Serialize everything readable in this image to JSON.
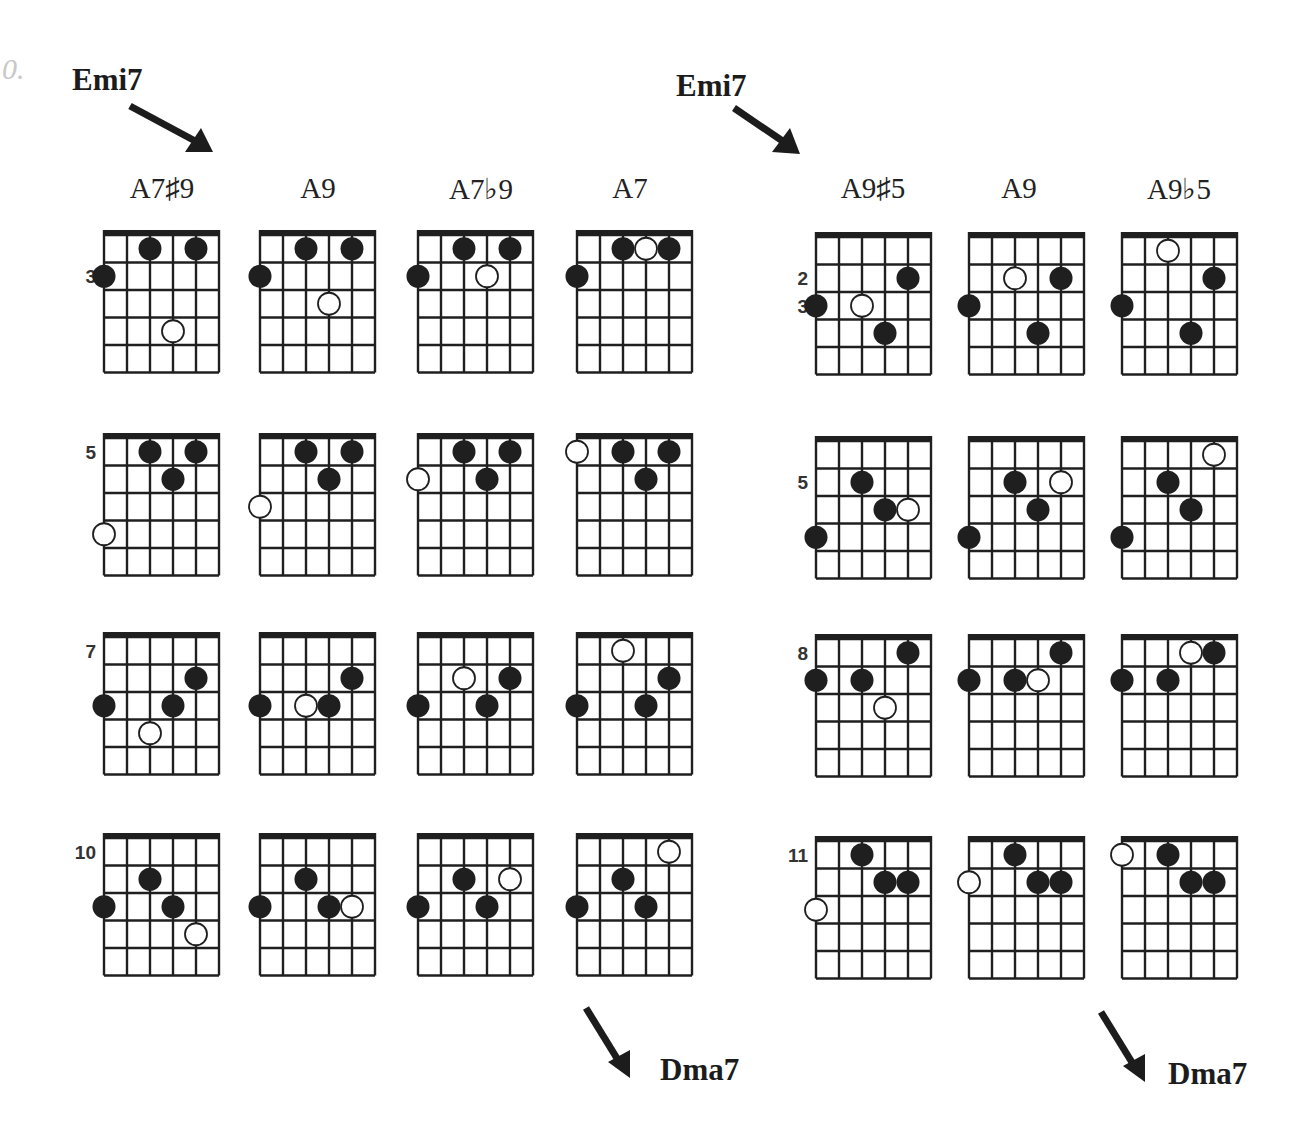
{
  "exercise_number": "0.",
  "left_block": {
    "start_chord": "Emi7",
    "end_chord": "Dma7",
    "columns": [
      "A7♯9",
      "A9",
      "A7♭9",
      "A7"
    ]
  },
  "right_block": {
    "start_chord": "Emi7",
    "end_chord": "Dma7",
    "columns": [
      "A9♯5",
      "A9",
      "A9♭5"
    ]
  },
  "colors": {
    "ink": "#1f1f1f",
    "open_fill": "#ffffff"
  },
  "diagram_spec": {
    "strings": 6,
    "frets": 5,
    "string_order": "low E (left) to high E (right)"
  },
  "diagrams": [
    {
      "block": "left",
      "row": 0,
      "col": 0,
      "chord": "A7♯9",
      "fret_labels": [
        {
          "fret": 2,
          "text": "3"
        }
      ],
      "dots": [
        {
          "s": 2,
          "f": 1,
          "t": "filled"
        },
        {
          "s": 4,
          "f": 1,
          "t": "filled"
        },
        {
          "s": 0,
          "f": 2,
          "t": "filled"
        },
        {
          "s": 3,
          "f": 4,
          "t": "open"
        }
      ]
    },
    {
      "block": "left",
      "row": 0,
      "col": 1,
      "chord": "A9",
      "fret_labels": [],
      "dots": [
        {
          "s": 2,
          "f": 1,
          "t": "filled"
        },
        {
          "s": 4,
          "f": 1,
          "t": "filled"
        },
        {
          "s": 0,
          "f": 2,
          "t": "filled"
        },
        {
          "s": 3,
          "f": 3,
          "t": "open"
        }
      ]
    },
    {
      "block": "left",
      "row": 0,
      "col": 2,
      "chord": "A7♭9",
      "fret_labels": [],
      "dots": [
        {
          "s": 2,
          "f": 1,
          "t": "filled"
        },
        {
          "s": 4,
          "f": 1,
          "t": "filled"
        },
        {
          "s": 0,
          "f": 2,
          "t": "filled"
        },
        {
          "s": 3,
          "f": 2,
          "t": "open"
        }
      ]
    },
    {
      "block": "left",
      "row": 0,
      "col": 3,
      "chord": "A7",
      "fret_labels": [],
      "dots": [
        {
          "s": 2,
          "f": 1,
          "t": "filled"
        },
        {
          "s": 4,
          "f": 1,
          "t": "filled"
        },
        {
          "s": 0,
          "f": 2,
          "t": "filled"
        },
        {
          "s": 3,
          "f": 1,
          "t": "open"
        }
      ]
    },
    {
      "block": "left",
      "row": 1,
      "col": 0,
      "chord": "A7♯9",
      "fret_labels": [
        {
          "fret": 1,
          "text": "5"
        }
      ],
      "dots": [
        {
          "s": 2,
          "f": 1,
          "t": "filled"
        },
        {
          "s": 4,
          "f": 1,
          "t": "filled"
        },
        {
          "s": 3,
          "f": 2,
          "t": "filled"
        },
        {
          "s": 0,
          "f": 4,
          "t": "open"
        }
      ]
    },
    {
      "block": "left",
      "row": 1,
      "col": 1,
      "chord": "A9",
      "fret_labels": [],
      "dots": [
        {
          "s": 2,
          "f": 1,
          "t": "filled"
        },
        {
          "s": 4,
          "f": 1,
          "t": "filled"
        },
        {
          "s": 3,
          "f": 2,
          "t": "filled"
        },
        {
          "s": 0,
          "f": 3,
          "t": "open"
        }
      ]
    },
    {
      "block": "left",
      "row": 1,
      "col": 2,
      "chord": "A7♭9",
      "fret_labels": [],
      "dots": [
        {
          "s": 2,
          "f": 1,
          "t": "filled"
        },
        {
          "s": 4,
          "f": 1,
          "t": "filled"
        },
        {
          "s": 3,
          "f": 2,
          "t": "filled"
        },
        {
          "s": 0,
          "f": 2,
          "t": "open"
        }
      ]
    },
    {
      "block": "left",
      "row": 1,
      "col": 3,
      "chord": "A7",
      "fret_labels": [],
      "dots": [
        {
          "s": 0,
          "f": 1,
          "t": "open"
        },
        {
          "s": 2,
          "f": 1,
          "t": "filled"
        },
        {
          "s": 4,
          "f": 1,
          "t": "filled"
        },
        {
          "s": 3,
          "f": 2,
          "t": "filled"
        }
      ]
    },
    {
      "block": "left",
      "row": 2,
      "col": 0,
      "chord": "A7♯9",
      "fret_labels": [
        {
          "fret": 1,
          "text": "7"
        }
      ],
      "dots": [
        {
          "s": 4,
          "f": 2,
          "t": "filled"
        },
        {
          "s": 0,
          "f": 3,
          "t": "filled"
        },
        {
          "s": 3,
          "f": 3,
          "t": "filled"
        },
        {
          "s": 2,
          "f": 4,
          "t": "open"
        }
      ]
    },
    {
      "block": "left",
      "row": 2,
      "col": 1,
      "chord": "A9",
      "fret_labels": [],
      "dots": [
        {
          "s": 4,
          "f": 2,
          "t": "filled"
        },
        {
          "s": 0,
          "f": 3,
          "t": "filled"
        },
        {
          "s": 3,
          "f": 3,
          "t": "filled"
        },
        {
          "s": 2,
          "f": 3,
          "t": "open"
        }
      ]
    },
    {
      "block": "left",
      "row": 2,
      "col": 2,
      "chord": "A7♭9",
      "fret_labels": [],
      "dots": [
        {
          "s": 2,
          "f": 2,
          "t": "open"
        },
        {
          "s": 4,
          "f": 2,
          "t": "filled"
        },
        {
          "s": 0,
          "f": 3,
          "t": "filled"
        },
        {
          "s": 3,
          "f": 3,
          "t": "filled"
        }
      ]
    },
    {
      "block": "left",
      "row": 2,
      "col": 3,
      "chord": "A7",
      "fret_labels": [],
      "dots": [
        {
          "s": 2,
          "f": 1,
          "t": "open"
        },
        {
          "s": 4,
          "f": 2,
          "t": "filled"
        },
        {
          "s": 0,
          "f": 3,
          "t": "filled"
        },
        {
          "s": 3,
          "f": 3,
          "t": "filled"
        }
      ]
    },
    {
      "block": "left",
      "row": 3,
      "col": 0,
      "chord": "A7♯9",
      "fret_labels": [
        {
          "fret": 1,
          "text": "10"
        }
      ],
      "dots": [
        {
          "s": 2,
          "f": 2,
          "t": "filled"
        },
        {
          "s": 0,
          "f": 3,
          "t": "filled"
        },
        {
          "s": 3,
          "f": 3,
          "t": "filled"
        },
        {
          "s": 4,
          "f": 4,
          "t": "open"
        }
      ]
    },
    {
      "block": "left",
      "row": 3,
      "col": 1,
      "chord": "A9",
      "fret_labels": [],
      "dots": [
        {
          "s": 2,
          "f": 2,
          "t": "filled"
        },
        {
          "s": 0,
          "f": 3,
          "t": "filled"
        },
        {
          "s": 3,
          "f": 3,
          "t": "filled"
        },
        {
          "s": 4,
          "f": 3,
          "t": "open"
        }
      ]
    },
    {
      "block": "left",
      "row": 3,
      "col": 2,
      "chord": "A7♭9",
      "fret_labels": [],
      "dots": [
        {
          "s": 2,
          "f": 2,
          "t": "filled"
        },
        {
          "s": 0,
          "f": 3,
          "t": "filled"
        },
        {
          "s": 3,
          "f": 3,
          "t": "filled"
        },
        {
          "s": 4,
          "f": 2,
          "t": "open"
        }
      ]
    },
    {
      "block": "left",
      "row": 3,
      "col": 3,
      "chord": "A7",
      "fret_labels": [],
      "dots": [
        {
          "s": 4,
          "f": 1,
          "t": "open"
        },
        {
          "s": 2,
          "f": 2,
          "t": "filled"
        },
        {
          "s": 0,
          "f": 3,
          "t": "filled"
        },
        {
          "s": 3,
          "f": 3,
          "t": "filled"
        }
      ]
    },
    {
      "block": "right",
      "row": 0,
      "col": 0,
      "chord": "A9♯5",
      "fret_labels": [
        {
          "fret": 2,
          "text": "2"
        },
        {
          "fret": 3,
          "text": "3"
        }
      ],
      "dots": [
        {
          "s": 4,
          "f": 2,
          "t": "filled"
        },
        {
          "s": 0,
          "f": 3,
          "t": "filled"
        },
        {
          "s": 3,
          "f": 4,
          "t": "filled"
        },
        {
          "s": 2,
          "f": 3,
          "t": "open"
        }
      ]
    },
    {
      "block": "right",
      "row": 0,
      "col": 1,
      "chord": "A9",
      "fret_labels": [],
      "dots": [
        {
          "s": 4,
          "f": 2,
          "t": "filled"
        },
        {
          "s": 0,
          "f": 3,
          "t": "filled"
        },
        {
          "s": 3,
          "f": 4,
          "t": "filled"
        },
        {
          "s": 2,
          "f": 2,
          "t": "open"
        }
      ]
    },
    {
      "block": "right",
      "row": 0,
      "col": 2,
      "chord": "A9♭5",
      "fret_labels": [],
      "dots": [
        {
          "s": 2,
          "f": 1,
          "t": "open"
        },
        {
          "s": 4,
          "f": 2,
          "t": "filled"
        },
        {
          "s": 0,
          "f": 3,
          "t": "filled"
        },
        {
          "s": 3,
          "f": 4,
          "t": "filled"
        }
      ]
    },
    {
      "block": "right",
      "row": 1,
      "col": 0,
      "chord": "A9♯5",
      "fret_labels": [
        {
          "fret": 2,
          "text": "5"
        }
      ],
      "dots": [
        {
          "s": 2,
          "f": 2,
          "t": "filled"
        },
        {
          "s": 3,
          "f": 3,
          "t": "filled"
        },
        {
          "s": 0,
          "f": 4,
          "t": "filled"
        },
        {
          "s": 4,
          "f": 3,
          "t": "open"
        }
      ]
    },
    {
      "block": "right",
      "row": 1,
      "col": 1,
      "chord": "A9",
      "fret_labels": [],
      "dots": [
        {
          "s": 2,
          "f": 2,
          "t": "filled"
        },
        {
          "s": 3,
          "f": 3,
          "t": "filled"
        },
        {
          "s": 0,
          "f": 4,
          "t": "filled"
        },
        {
          "s": 4,
          "f": 2,
          "t": "open"
        }
      ]
    },
    {
      "block": "right",
      "row": 1,
      "col": 2,
      "chord": "A9♭5",
      "fret_labels": [],
      "dots": [
        {
          "s": 4,
          "f": 1,
          "t": "open"
        },
        {
          "s": 2,
          "f": 2,
          "t": "filled"
        },
        {
          "s": 3,
          "f": 3,
          "t": "filled"
        },
        {
          "s": 0,
          "f": 4,
          "t": "filled"
        }
      ]
    },
    {
      "block": "right",
      "row": 2,
      "col": 0,
      "chord": "A9♯5",
      "fret_labels": [
        {
          "fret": 1,
          "text": "8"
        }
      ],
      "dots": [
        {
          "s": 4,
          "f": 1,
          "t": "filled"
        },
        {
          "s": 0,
          "f": 2,
          "t": "filled"
        },
        {
          "s": 2,
          "f": 2,
          "t": "filled"
        },
        {
          "s": 3,
          "f": 3,
          "t": "open"
        }
      ]
    },
    {
      "block": "right",
      "row": 2,
      "col": 1,
      "chord": "A9",
      "fret_labels": [],
      "dots": [
        {
          "s": 4,
          "f": 1,
          "t": "filled"
        },
        {
          "s": 0,
          "f": 2,
          "t": "filled"
        },
        {
          "s": 2,
          "f": 2,
          "t": "filled"
        },
        {
          "s": 3,
          "f": 2,
          "t": "open"
        }
      ]
    },
    {
      "block": "right",
      "row": 2,
      "col": 2,
      "chord": "A9♭5",
      "fret_labels": [],
      "dots": [
        {
          "s": 3,
          "f": 1,
          "t": "open"
        },
        {
          "s": 4,
          "f": 1,
          "t": "filled"
        },
        {
          "s": 0,
          "f": 2,
          "t": "filled"
        },
        {
          "s": 2,
          "f": 2,
          "t": "filled"
        }
      ]
    },
    {
      "block": "right",
      "row": 3,
      "col": 0,
      "chord": "A9♯5",
      "fret_labels": [
        {
          "fret": 1,
          "text": "11"
        }
      ],
      "dots": [
        {
          "s": 2,
          "f": 1,
          "t": "filled"
        },
        {
          "s": 3,
          "f": 2,
          "t": "filled"
        },
        {
          "s": 4,
          "f": 2,
          "t": "filled"
        },
        {
          "s": 0,
          "f": 3,
          "t": "open"
        }
      ]
    },
    {
      "block": "right",
      "row": 3,
      "col": 1,
      "chord": "A9",
      "fret_labels": [],
      "dots": [
        {
          "s": 2,
          "f": 1,
          "t": "filled"
        },
        {
          "s": 3,
          "f": 2,
          "t": "filled"
        },
        {
          "s": 4,
          "f": 2,
          "t": "filled"
        },
        {
          "s": 0,
          "f": 2,
          "t": "open"
        }
      ]
    },
    {
      "block": "right",
      "row": 3,
      "col": 2,
      "chord": "A9♭5",
      "fret_labels": [],
      "dots": [
        {
          "s": 0,
          "f": 1,
          "t": "open"
        },
        {
          "s": 2,
          "f": 1,
          "t": "filled"
        },
        {
          "s": 3,
          "f": 2,
          "t": "filled"
        },
        {
          "s": 4,
          "f": 2,
          "t": "filled"
        }
      ]
    }
  ]
}
